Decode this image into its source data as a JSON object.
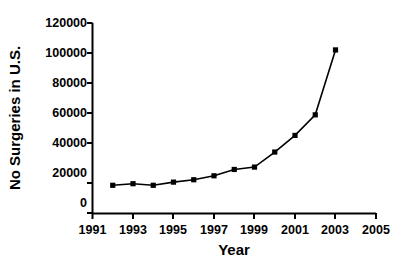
{
  "chart_data": {
    "type": "line",
    "title": "",
    "subtitle": "",
    "xlabel": "Year",
    "ylabel": "No Surgeries in U.S.",
    "xlim": [
      1991,
      2005
    ],
    "ylim": [
      0,
      120000
    ],
    "xticks": [
      1991,
      1993,
      1995,
      1997,
      1999,
      2001,
      2003,
      2005
    ],
    "xtick_labels": [
      "1991",
      "1993",
      "1995",
      "1997",
      "1999",
      "2001",
      "2003",
      "2005"
    ],
    "xminor_ticks": [
      1992,
      1994,
      1996,
      1998,
      2000,
      2002,
      2004
    ],
    "yticks": [
      0,
      20000,
      40000,
      60000,
      80000,
      100000,
      120000
    ],
    "ytick_labels": [
      "0",
      "20000",
      "40000",
      "60000",
      "80000",
      "100000",
      "120000"
    ],
    "grid": false,
    "legend": false,
    "legend_position": "none",
    "marker": "square",
    "line_color": "#000000",
    "marker_color": "#000000",
    "x": [
      1992,
      1993,
      1994,
      1995,
      1996,
      1997,
      1998,
      1999,
      2000,
      2001,
      2002,
      2003
    ],
    "values": [
      17500,
      18500,
      17500,
      19500,
      21000,
      23500,
      27500,
      29000,
      38500,
      49000,
      62000,
      103000
    ],
    "series": [
      {
        "name": "No Surgeries in U.S.",
        "x": [
          1992,
          1993,
          1994,
          1995,
          1996,
          1997,
          1998,
          1999,
          2000,
          2001,
          2002,
          2003
        ],
        "values": [
          17500,
          18500,
          17500,
          19500,
          21000,
          23500,
          27500,
          29000,
          38500,
          49000,
          62000,
          103000
        ]
      }
    ],
    "annotations": []
  },
  "figure": {
    "background_color": "#ffffff",
    "axis_color": "#000000",
    "text_color": "#000000"
  }
}
